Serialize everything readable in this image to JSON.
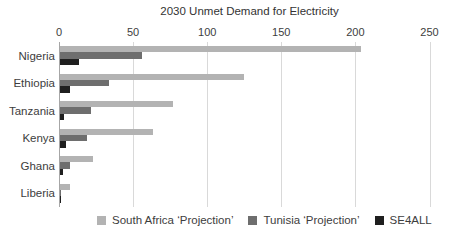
{
  "chart_data": {
    "type": "bar",
    "orientation": "horizontal",
    "title": "2030 Unmet Demand for Electricity",
    "categories": [
      "Nigeria",
      "Ethiopia",
      "Tanzania",
      "Kenya",
      "Ghana",
      "Liberia"
    ],
    "series": [
      {
        "name": "South Africa ‘Projection’",
        "color": "#b3b3b3",
        "values": [
          203,
          124,
          76,
          63,
          22,
          7
        ]
      },
      {
        "name": "Tunisia ‘Projection’",
        "color": "#6e6e6e",
        "values": [
          55,
          33,
          21,
          18,
          7,
          1
        ]
      },
      {
        "name": "SE4ALL",
        "color": "#1f1f1f",
        "values": [
          13,
          7,
          3,
          4,
          2,
          0.5
        ]
      }
    ],
    "x_axis": {
      "position": "top",
      "min": 0,
      "max": 250,
      "ticks": [
        0,
        50,
        100,
        150,
        200,
        250
      ]
    },
    "grid": true,
    "legend_position": "bottom",
    "colors": {
      "gridline": "#d9d9d9",
      "axis_line": "#a6a6a6",
      "text": "#3d3d3d",
      "background": "#ffffff"
    }
  }
}
